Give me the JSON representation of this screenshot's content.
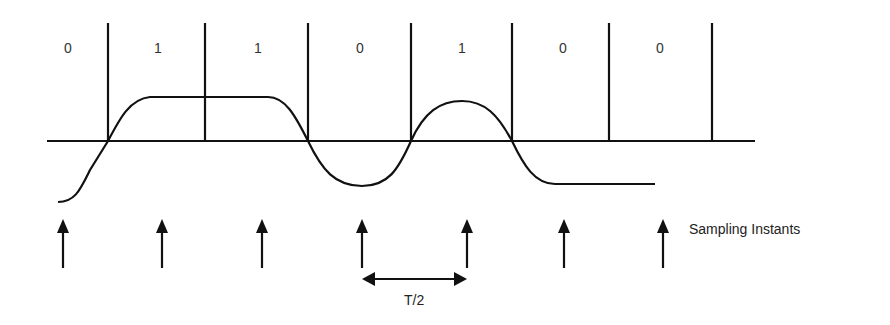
{
  "diagram": {
    "bits": [
      "0",
      "1",
      "1",
      "0",
      "1",
      "0",
      "0"
    ],
    "bit_label_x": [
      68,
      158,
      258,
      360,
      462,
      563,
      660
    ],
    "boundaries_x": [
      108,
      205,
      308,
      411,
      512,
      609,
      712
    ],
    "sample_x": [
      63,
      162,
      262,
      362,
      467,
      564,
      663
    ],
    "sampling_label": "Sampling Instants",
    "interval_label": "T/2",
    "stroke_color": "#111111"
  }
}
